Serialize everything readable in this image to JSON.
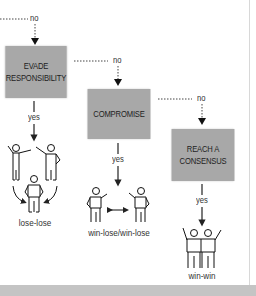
{
  "diagram": {
    "type": "flowchart",
    "branches": [
      {
        "decision": "no",
        "label_pos": "top"
      },
      {
        "decision": "no"
      },
      {
        "decision": "no"
      }
    ],
    "boxes": [
      {
        "line1": "EVADE",
        "line2": "RESPONSIBILITY",
        "yes_label": "yes",
        "outcome": "lose-lose"
      },
      {
        "line1": "COMPROMISE",
        "line2": "",
        "yes_label": "yes",
        "outcome": "win-lose/win-lose"
      },
      {
        "line1": "REACH A",
        "line2": "CONSENSUS",
        "yes_label": "yes",
        "outcome": "win-win"
      }
    ],
    "colors": {
      "box": "#a8a8a8",
      "text": "#1e1e1e",
      "line": "#333333",
      "band": "#c4c4c4"
    }
  }
}
